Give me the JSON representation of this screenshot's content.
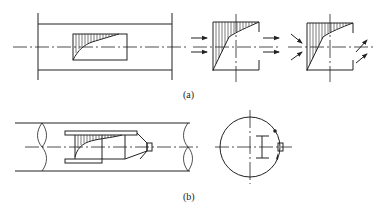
{
  "figure": {
    "subfigures": [
      {
        "id": "a",
        "label": "(a)",
        "description": "Channel section with inserted plate showing velocity profile; flow arrows parallel (left) and inclined (right)"
      },
      {
        "id": "b",
        "label": "(b)",
        "description": "Pipe section with probe insert carrying velocity profile; cross-section view with probe mount"
      }
    ]
  },
  "colors": {
    "stroke": "#222222",
    "background": "#ffffff"
  }
}
